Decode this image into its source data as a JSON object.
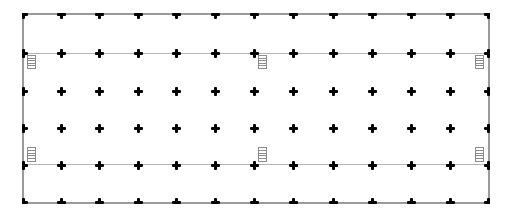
{
  "plan": {
    "type": "floor-plan",
    "colors": {
      "wall": "#9a9a9a",
      "gridline": "#b4b4b4",
      "column": "#000000",
      "stair": "#8c8c8c",
      "background": "#ffffff"
    },
    "outline": {
      "left": 23,
      "top": 13,
      "right": 489,
      "bottom": 203
    },
    "column_grid": {
      "x": [
        23,
        61,
        99,
        138,
        176,
        215,
        254,
        293,
        333,
        372,
        411,
        450,
        488
      ],
      "y": [
        14,
        53,
        91,
        128,
        165,
        202
      ]
    },
    "interior_lines_y": [
      53,
      164
    ],
    "stairs": [
      {
        "id": "stair-top-left",
        "x": 27,
        "y": 55,
        "w": 9,
        "h": 14,
        "treads": 5
      },
      {
        "id": "stair-top-middle",
        "x": 258,
        "y": 55,
        "w": 9,
        "h": 14,
        "treads": 5
      },
      {
        "id": "stair-top-right",
        "x": 475,
        "y": 55,
        "w": 9,
        "h": 14,
        "treads": 5
      },
      {
        "id": "stair-bottom-left",
        "x": 27,
        "y": 147,
        "w": 9,
        "h": 15,
        "treads": 5
      },
      {
        "id": "stair-bottom-middle",
        "x": 258,
        "y": 147,
        "w": 9,
        "h": 15,
        "treads": 5
      },
      {
        "id": "stair-bottom-right",
        "x": 475,
        "y": 147,
        "w": 9,
        "h": 15,
        "treads": 5
      }
    ]
  }
}
